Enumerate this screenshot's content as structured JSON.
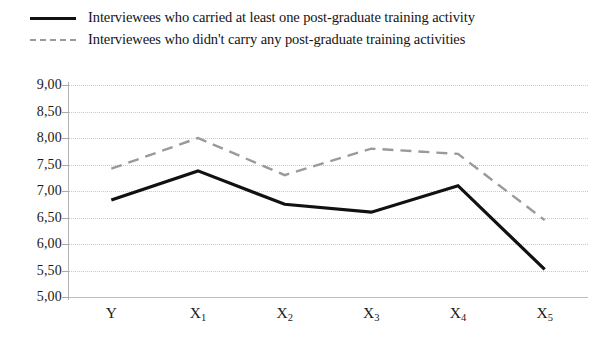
{
  "legend": {
    "position": "top-left",
    "items": [
      {
        "label": "Interviewees who carried at least one post-graduate training activity",
        "marker": "solid-line-swatch",
        "color": "#111111",
        "style": "solid"
      },
      {
        "label": "Interviewees who didn't carry any post-graduate training activities",
        "marker": "dashed-line-swatch",
        "color": "#9a9a9a",
        "style": "dashed"
      }
    ]
  },
  "axes": {
    "y_tick_labels": [
      "9,00",
      "8,50",
      "8,00",
      "7,50",
      "7,00",
      "6,50",
      "6,00",
      "5,50",
      "5,00"
    ],
    "x_tick_labels": [
      {
        "base": "Y",
        "sub": ""
      },
      {
        "base": "X",
        "sub": "1"
      },
      {
        "base": "X",
        "sub": "2"
      },
      {
        "base": "X",
        "sub": "3"
      },
      {
        "base": "X",
        "sub": "4"
      },
      {
        "base": "X",
        "sub": "5"
      }
    ]
  },
  "chart_data": {
    "type": "line",
    "title": "",
    "subtitle": "",
    "xlabel": "",
    "ylabel": "",
    "categories": [
      "Y",
      "X1",
      "X2",
      "X3",
      "X4",
      "X5"
    ],
    "ylim": [
      5.0,
      9.0
    ],
    "ytick_step": 0.5,
    "yticks": [
      5.0,
      5.5,
      6.0,
      6.5,
      7.0,
      7.5,
      8.0,
      8.5,
      9.0
    ],
    "decimal_separator": ",",
    "grid": {
      "horizontal": true,
      "vertical": false,
      "style": "dotted",
      "color": "#c9c9c9"
    },
    "legend_position": "top-left",
    "series": [
      {
        "name": "Interviewees who carried at least one post-graduate training activity",
        "style": "solid",
        "color": "#111111",
        "width": 3.2,
        "values": [
          6.83,
          7.38,
          6.75,
          6.6,
          7.1,
          5.52
        ]
      },
      {
        "name": "Interviewees who didn't carry any post-graduate training activities",
        "style": "dashed",
        "color": "#9a9a9a",
        "width": 2.4,
        "values": [
          7.42,
          8.0,
          7.3,
          7.8,
          7.7,
          6.45
        ]
      }
    ]
  }
}
